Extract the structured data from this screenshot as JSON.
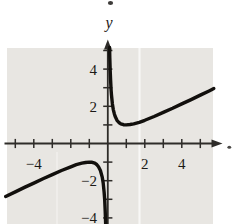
{
  "figure": {
    "colors": {
      "plot_bg": "#e8e6e2",
      "axis": "#2e2c29",
      "curve": "#12100d",
      "label": "#1b1916",
      "streak": "#ffffff"
    }
  },
  "chart_data": {
    "type": "line",
    "title": "",
    "xlabel": "",
    "ylabel": "y",
    "grid": "off",
    "description_of_data": "Graph of a rational function with vertical asymptote x=0 and slant asymptote y=x/2; right branch has minimum (1,1), left branch has maximum (-1,-1); consistent with y=(x^2+1)/(2x)",
    "x_range": [
      -5.6,
      6.2
    ],
    "y_range": [
      -4.4,
      5.6
    ],
    "x_ticks": [
      -5,
      -4,
      -3,
      -2,
      -1,
      1,
      2,
      3,
      4,
      5
    ],
    "y_ticks": [
      -4,
      -3,
      -2,
      -1,
      1,
      2,
      3,
      4,
      5
    ],
    "x_tick_labels": [
      {
        "value": -4,
        "label": "−4"
      },
      {
        "value": 2,
        "label": "2"
      },
      {
        "value": 4,
        "label": "4"
      }
    ],
    "y_tick_labels": [
      {
        "value": 4,
        "label": "4"
      },
      {
        "value": 2,
        "label": "2"
      },
      {
        "value": -2,
        "label": "−2"
      },
      {
        "value": -4,
        "label": "−4"
      }
    ],
    "series": [
      {
        "name": "left-branch",
        "points": [
          [
            -5.52,
            -2.85
          ],
          [
            -5,
            -2.6
          ],
          [
            -4.5,
            -2.36
          ],
          [
            -4,
            -2.13
          ],
          [
            -3.5,
            -1.89
          ],
          [
            -3,
            -1.67
          ],
          [
            -2.5,
            -1.45
          ],
          [
            -2,
            -1.25
          ],
          [
            -1.7,
            -1.14
          ],
          [
            -1.4,
            -1.06
          ],
          [
            -1.2,
            -1.02
          ],
          [
            -1,
            -1
          ],
          [
            -0.85,
            -1.01
          ],
          [
            -0.7,
            -1.06
          ],
          [
            -0.6,
            -1.13
          ],
          [
            -0.5,
            -1.25
          ],
          [
            -0.4,
            -1.45
          ],
          [
            -0.3,
            -1.82
          ],
          [
            -0.25,
            -2.13
          ],
          [
            -0.2,
            -2.6
          ],
          [
            -0.17,
            -3.03
          ],
          [
            -0.14,
            -3.64
          ],
          [
            -0.12,
            -4.23
          ],
          [
            -0.115,
            -4.4
          ]
        ]
      },
      {
        "name": "right-branch",
        "points": [
          [
            0.098,
            5.16
          ],
          [
            0.11,
            4.61
          ],
          [
            0.13,
            3.91
          ],
          [
            0.15,
            3.41
          ],
          [
            0.18,
            2.87
          ],
          [
            0.2,
            2.6
          ],
          [
            0.25,
            2.13
          ],
          [
            0.3,
            1.82
          ],
          [
            0.35,
            1.6
          ],
          [
            0.4,
            1.45
          ],
          [
            0.5,
            1.25
          ],
          [
            0.6,
            1.13
          ],
          [
            0.7,
            1.06
          ],
          [
            0.85,
            1.01
          ],
          [
            1,
            1
          ],
          [
            1.2,
            1.02
          ],
          [
            1.4,
            1.06
          ],
          [
            1.7,
            1.14
          ],
          [
            2,
            1.25
          ],
          [
            2.5,
            1.45
          ],
          [
            3,
            1.67
          ],
          [
            3.5,
            1.89
          ],
          [
            4,
            2.13
          ],
          [
            4.5,
            2.36
          ],
          [
            5,
            2.6
          ],
          [
            5.5,
            2.84
          ],
          [
            5.73,
            2.95
          ]
        ]
      }
    ],
    "layout": {
      "canvas_px": [
        232,
        224
      ],
      "plot_area_px": {
        "left": 7,
        "top": 48,
        "right": 213,
        "bottom": 224
      },
      "origin_px": [
        107.8,
        143.5
      ],
      "px_per_unit": [
        18.5,
        18.6
      ],
      "tick_half_len_px": 4.6,
      "x_label_dy_px": 25,
      "y_label_x_px": 97,
      "y_label_dy_px": 5.5,
      "streaks_px": [
        {
          "x": 139.5,
          "y1": 48,
          "y2": 224,
          "width": 2.2,
          "opacity": 0.7
        },
        {
          "x": 57,
          "y1": 152,
          "y2": 224,
          "width": 2,
          "opacity": 0.3
        }
      ]
    }
  }
}
